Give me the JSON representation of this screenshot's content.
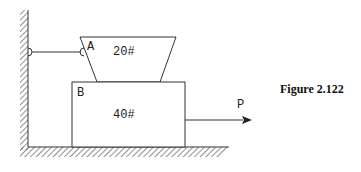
{
  "figure": {
    "caption": "Figure 2.122"
  },
  "labels": {
    "block_a": "A",
    "block_b": "B",
    "weight_a": "20#",
    "weight_b": "40#",
    "force": "P"
  },
  "colors": {
    "stroke": "#333333",
    "background": "#ffffff"
  }
}
